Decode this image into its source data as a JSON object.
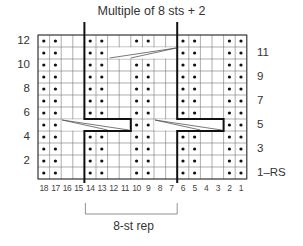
{
  "title": "Multiple of 8 sts + 2",
  "grid": {
    "columns": 18,
    "rows": 12,
    "column_order": "right-to-left (18 at left, 1 at right)",
    "row_order": "bottom-to-top (1 at bottom, 12 at top)"
  },
  "row_labels_left": [
    "12",
    "10",
    "8",
    "6",
    "4",
    "2"
  ],
  "row_labels_right": [
    "11",
    "9",
    "7",
    "5",
    "3",
    "1–RS"
  ],
  "column_labels": [
    "18",
    "17",
    "16",
    "15",
    "14",
    "13",
    "12",
    "11",
    "10",
    "9",
    "8",
    "7",
    "6",
    "5",
    "4",
    "3",
    "2",
    "1"
  ],
  "purl_stitches": {
    "12": [
      18,
      17,
      14,
      13,
      10,
      9,
      6,
      5,
      2,
      1
    ],
    "11": [
      18,
      17,
      14,
      13,
      6,
      5,
      2,
      1
    ],
    "10": [
      18,
      17,
      14,
      13,
      10,
      9,
      6,
      5,
      2,
      1
    ],
    "9": [
      18,
      17,
      14,
      13,
      10,
      9,
      6,
      5,
      2,
      1
    ],
    "8": [
      18,
      17,
      14,
      13,
      10,
      9,
      6,
      5,
      2,
      1
    ],
    "7": [
      18,
      17,
      14,
      13,
      10,
      9,
      6,
      5,
      2,
      1
    ],
    "6": [
      18,
      17,
      14,
      13,
      10,
      9,
      6,
      5,
      2,
      1
    ],
    "5": [
      18,
      17,
      10,
      9,
      2,
      1
    ],
    "4": [
      18,
      17,
      14,
      13,
      10,
      9,
      6,
      5,
      2,
      1
    ],
    "3": [
      18,
      17,
      14,
      13,
      10,
      9,
      6,
      5,
      2,
      1
    ],
    "2": [
      18,
      17,
      14,
      13,
      10,
      9,
      6,
      5,
      2,
      1
    ],
    "1": [
      18,
      17,
      14,
      13,
      10,
      9,
      6,
      5,
      2,
      1
    ]
  },
  "cables": [
    {
      "row": 11,
      "from_col": 12,
      "to_col": 7,
      "symbol": "right-leaning cable"
    },
    {
      "row": 5,
      "from_col": 16,
      "to_col": 11,
      "symbol": "left-leaning cable"
    },
    {
      "row": 5,
      "from_col": 8,
      "to_col": 3,
      "symbol": "left-leaning cable"
    }
  ],
  "repeat": {
    "label": "8-st rep",
    "from_col": 14,
    "to_col": 7
  },
  "legend_symbols": {
    "dot": "purl on RS, knit on WS",
    "blank": "knit on RS, purl on WS"
  }
}
